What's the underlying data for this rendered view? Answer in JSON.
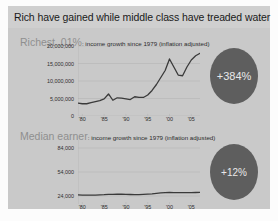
{
  "header": {
    "title": "Rich have gained while middle class have treaded water"
  },
  "charts": [
    {
      "id": "richest",
      "label_big": "Richest .01%",
      "label_small": ": income growth since 1979 (inflation adjusted)",
      "badge": "+384%"
    },
    {
      "id": "median",
      "label_big": "Median earner",
      "label_small": ": income growth since 1979 (inflation adjusted)",
      "badge": "+12%"
    }
  ],
  "colors": {
    "panel": "#c9c9c9",
    "title_band": "#cfcfcf",
    "badge": "#5e5e5e",
    "line": "#3a3a3a",
    "grid": "#b0b0b0"
  },
  "chart_data": [
    {
      "type": "line",
      "title": "Richest .01%: income growth since 1979 (inflation adjusted)",
      "xlabel": "",
      "ylabel": "",
      "grid": true,
      "legend": "none",
      "ylim": [
        0,
        20000000
      ],
      "xlim": [
        1979,
        2007
      ],
      "yticks": [
        0,
        5000000,
        10000000,
        15000000,
        20000000
      ],
      "ytick_labels": [
        "0",
        "5,000,000",
        "10,000,000",
        "15,000,000",
        "20,000,000"
      ],
      "xticks": [
        1980,
        1985,
        1990,
        1995,
        2000,
        2005
      ],
      "xtick_labels": [
        "'80",
        "'85",
        "'90",
        "'95",
        "'00",
        "'05"
      ],
      "series": [
        {
          "name": "Richest .01% average income",
          "x": [
            1979,
            1980,
            1981,
            1982,
            1983,
            1984,
            1985,
            1986,
            1987,
            1988,
            1989,
            1990,
            1991,
            1992,
            1993,
            1994,
            1995,
            1996,
            1997,
            1998,
            1999,
            2000,
            2001,
            2002,
            2003,
            2004,
            2005,
            2006,
            2007
          ],
          "values": [
            3700000,
            3500000,
            3500000,
            3800000,
            4100000,
            4400000,
            4900000,
            6300000,
            4500000,
            5200000,
            5100000,
            4900000,
            4700000,
            5500000,
            5300000,
            5300000,
            6000000,
            7300000,
            9000000,
            11000000,
            13000000,
            16300000,
            14000000,
            11700000,
            11500000,
            14000000,
            16000000,
            17200000,
            17900000
          ]
        }
      ]
    },
    {
      "type": "line",
      "title": "Median earner: income growth since 1979 (inflation adjusted)",
      "xlabel": "",
      "ylabel": "",
      "grid": true,
      "legend": "none",
      "ylim": [
        14000,
        94000
      ],
      "xlim": [
        1979,
        2007
      ],
      "yticks": [
        24000,
        54000,
        84000
      ],
      "ytick_labels": [
        "24,000",
        "54,000",
        "84,000"
      ],
      "xticks": [
        1980,
        1985,
        1990,
        1995,
        2000,
        2005
      ],
      "xtick_labels": [
        "'80",
        "'85",
        "'90",
        "'95",
        "'00",
        "'05"
      ],
      "series": [
        {
          "name": "Median earner income",
          "x": [
            1979,
            1980,
            1981,
            1982,
            1983,
            1984,
            1985,
            1986,
            1987,
            1988,
            1989,
            1990,
            1991,
            1992,
            1993,
            1994,
            1995,
            1996,
            1997,
            1998,
            1999,
            2000,
            2001,
            2002,
            2003,
            2004,
            2005,
            2006,
            2007
          ],
          "values": [
            25400,
            25200,
            25100,
            25000,
            25100,
            25400,
            25600,
            26000,
            26100,
            26200,
            26300,
            26100,
            25900,
            25800,
            25800,
            26000,
            26300,
            26700,
            27300,
            27900,
            28200,
            28400,
            28300,
            28200,
            28200,
            28200,
            28300,
            28400,
            28500
          ]
        }
      ]
    }
  ]
}
